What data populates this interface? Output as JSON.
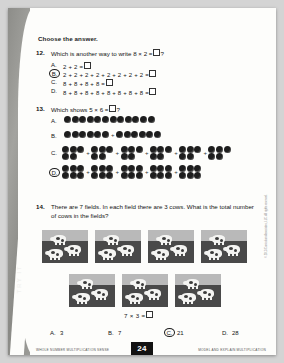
{
  "sidebar": {
    "tab_label": "TRY IT"
  },
  "prompt": "Choose the answer.",
  "questions": [
    {
      "number": "12.",
      "text_before": "Which is another way to write 8 × 2 =",
      "text_after": "?",
      "choices": [
        {
          "letter": "A.",
          "expression": "2 + 2 =",
          "selected": false
        },
        {
          "letter": "B.",
          "expression": "2 + 2 + 2 + 2 + 2 + 2 + 2 + 2 =",
          "selected": true
        },
        {
          "letter": "C.",
          "expression": "8 + 8 + 8 + 8 =",
          "selected": false
        },
        {
          "letter": "D.",
          "expression": "8 + 8 + 8 + 8 + 8 + 8 + 8 + 8 =",
          "selected": false
        }
      ]
    },
    {
      "number": "13.",
      "text_before": "Which shows 5 × 6 =",
      "text_after": "?",
      "choices": [
        {
          "letter": "A.",
          "selected": false,
          "groups": [
            12
          ],
          "rows": 1
        },
        {
          "letter": "B.",
          "selected": false,
          "groups": [
            6,
            6
          ],
          "rows": 1
        },
        {
          "letter": "C.",
          "selected": false,
          "groups": [
            5,
            5,
            5,
            5,
            5,
            5
          ],
          "rows": 2
        },
        {
          "letter": "D.",
          "selected": true,
          "groups": [
            6,
            6,
            6,
            6,
            6
          ],
          "rows": 2
        }
      ]
    },
    {
      "number": "14.",
      "text": "There are 7 fields. In each field there are 3 cows. What is the total number of cows in the fields?",
      "field_panels": 7,
      "cows_per_panel": 3,
      "equation": "7 × 3 =",
      "choices": [
        {
          "letter": "A.",
          "value": "3",
          "selected": false
        },
        {
          "letter": "B.",
          "value": "7",
          "selected": false
        },
        {
          "letter": "C.",
          "value": "21",
          "selected": true
        },
        {
          "letter": "D.",
          "value": "28",
          "selected": false
        }
      ]
    }
  ],
  "footer": {
    "left": "WHOLE NUMBER MULTIPLICATION SENSE",
    "page": "24",
    "right": "MODEL AND EXPLAIN MULTIPLICATION",
    "credit": "© 2013 Curriculum Associates, LLC. All rights reserved."
  }
}
